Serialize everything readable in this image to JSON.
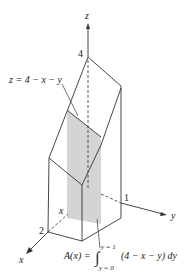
{
  "figure": {
    "axes": {
      "x_label": "x",
      "y_label": "y",
      "z_label": "z",
      "x_tick": "2",
      "y_tick": "1",
      "z_tick": "4",
      "x_slice_label": "x"
    },
    "surface_label": "z = 4 − x − y",
    "area_formula": {
      "lhs": "A(x) =",
      "integral": "∫",
      "upper_limit": "y = 1",
      "lower_limit": "y = 0",
      "integrand": "(4 − x − y) dy"
    },
    "colors": {
      "line": "#333333",
      "shade": "#d4d4d4",
      "text": "#222222"
    }
  }
}
